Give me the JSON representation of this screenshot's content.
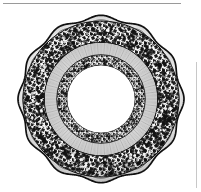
{
  "image": {
    "kind": "engraving",
    "subject": "decorative ceramic plate",
    "orientation": "top view",
    "width_px": 201,
    "height_px": 192,
    "background_color": "#ffffff",
    "ink_color": "#1a1a1a",
    "midtone_color": "#6e6e6e",
    "light_color": "#cfcfcf"
  },
  "plate": {
    "center_x": 101,
    "center_y": 99,
    "outer_radius_px": 84,
    "scallop_lobes": 12,
    "scallop_depth_px": 4,
    "rim_outline_color": "#141414",
    "rim_outline_width_px": 1.6,
    "zones": [
      {
        "name": "scalloped-outer-edge",
        "inner_radius_px": 78,
        "outer_radius_px": 84,
        "fill": "#ffffff",
        "description": "narrow white rim band inside the scalloped contour"
      },
      {
        "name": "floral-rim-band",
        "inner_radius_px": 56,
        "outer_radius_px": 78,
        "fill": "#2b2b2b",
        "description": "dense foliate and floral transfer-print border, heavy black texture"
      },
      {
        "name": "cavetto-hatched-band",
        "inner_radius_px": 44,
        "outer_radius_px": 56,
        "fill": "#f2f2f2",
        "description": "pale sloping well with fine radiating engraved hatch lines"
      },
      {
        "name": "inner-floral-ring",
        "inner_radius_px": 34,
        "outer_radius_px": 44,
        "fill": "#303030",
        "description": "narrow dense floral garland ring encircling the well"
      },
      {
        "name": "plate-well",
        "inner_radius_px": 0,
        "outer_radius_px": 34,
        "fill": "#ffffff",
        "description": "blank white centre of the plate"
      }
    ]
  },
  "page_marks": [
    {
      "name": "top-rule",
      "type": "horizontal-rule",
      "x_px": 3,
      "y_px": 3,
      "length_px": 178,
      "thickness_px": 1,
      "color": "#9a9a9a"
    },
    {
      "name": "right-rule",
      "type": "vertical-rule",
      "x_px": 196,
      "y_px": 62,
      "length_px": 126,
      "thickness_px": 1,
      "color": "#c8c8c8"
    }
  ],
  "labels": {
    "figure_title": "Scalloped plate with floral border"
  },
  "chart_data": null
}
